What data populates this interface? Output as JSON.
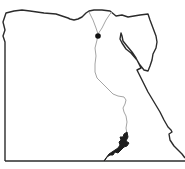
{
  "map": {
    "subject": "Egypt outline map",
    "colors": {
      "border": "#2b2b2b",
      "river": "#9a9a9a",
      "lake": "#1e1e1e",
      "city": "#111111",
      "background": "#ffffff"
    },
    "features": [
      {
        "name": "country-border",
        "type": "outline"
      },
      {
        "name": "nile-river",
        "type": "river"
      },
      {
        "name": "lake-nasser",
        "type": "lake"
      },
      {
        "name": "capital-marker",
        "type": "point"
      }
    ]
  }
}
